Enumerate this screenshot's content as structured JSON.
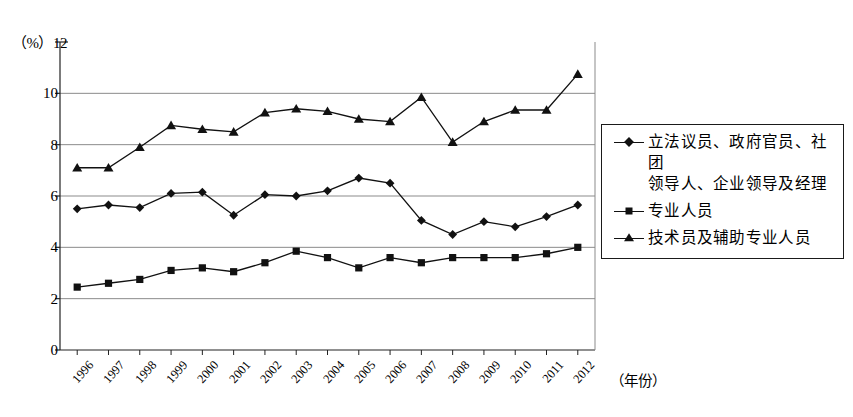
{
  "chart_data": {
    "type": "line",
    "title": "",
    "xlabel": "（年份）",
    "ylabel": "（%）",
    "ylim": [
      0,
      12
    ],
    "ytick_step": 2,
    "yticks": [
      "0",
      "2",
      "4",
      "6",
      "8",
      "10",
      "12"
    ],
    "grid": "horizontal",
    "legend_position": "right",
    "categories": [
      "1996",
      "1997",
      "1998",
      "1999",
      "2000",
      "2001",
      "2002",
      "2003",
      "2004",
      "2005",
      "2006",
      "2007",
      "2008",
      "2009",
      "2010",
      "2011",
      "2012"
    ],
    "series": [
      {
        "name": "立法议员、政府官员、社团领导人、企业领导及经理",
        "marker": "diamond",
        "color": "#111111",
        "values": [
          5.5,
          5.65,
          5.55,
          6.1,
          6.15,
          5.25,
          6.05,
          6.0,
          6.2,
          6.7,
          6.5,
          5.05,
          4.5,
          5.0,
          4.8,
          5.2,
          5.65
        ]
      },
      {
        "name": "专业人员",
        "marker": "square",
        "color": "#111111",
        "values": [
          2.45,
          2.6,
          2.75,
          3.1,
          3.2,
          3.05,
          3.4,
          3.85,
          3.6,
          3.2,
          3.6,
          3.4,
          3.6,
          3.6,
          3.6,
          3.75,
          4.0
        ]
      },
      {
        "name": "技术员及辅助专业人员",
        "marker": "triangle",
        "color": "#111111",
        "values": [
          7.1,
          7.1,
          7.9,
          8.75,
          8.6,
          8.5,
          9.25,
          9.4,
          9.3,
          9.0,
          8.9,
          9.85,
          8.1,
          8.9,
          9.35,
          9.35,
          10.75
        ]
      }
    ]
  },
  "legend": {
    "items": [
      {
        "label": "立法议员、政府官员、社团",
        "label2": "领导人、企业领导及经理",
        "marker": "diamond"
      },
      {
        "label": "专业人员",
        "label2": "",
        "marker": "square"
      },
      {
        "label": "技术员及辅助专业人员",
        "label2": "",
        "marker": "triangle"
      }
    ]
  },
  "axes": {
    "y_unit": "（%）",
    "x_title": "（年份）"
  }
}
